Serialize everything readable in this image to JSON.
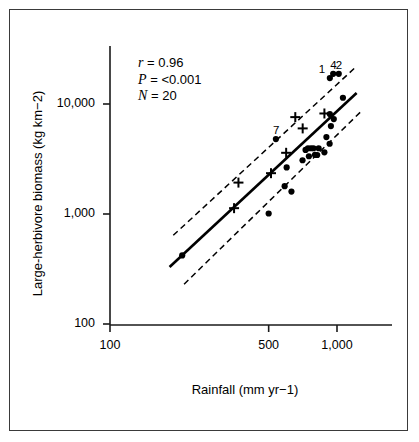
{
  "chart_data": {
    "type": "scatter",
    "title": "",
    "xlabel": "Rainfall (mm yr−1)",
    "ylabel": "Large-herbivore biomass (kg km−2)",
    "xscale": "log",
    "yscale": "log",
    "xlim": [
      100,
      1300
    ],
    "ylim": [
      100,
      30000
    ],
    "grid": false,
    "legend_position": "none",
    "xticks": [
      100,
      500,
      1000
    ],
    "xtick_labels": [
      "100",
      "500",
      "1,000"
    ],
    "yticks": [
      100,
      1000,
      10000
    ],
    "ytick_labels": [
      "100",
      "1,000",
      "10,000"
    ],
    "annotations": {
      "r_symbol": "r",
      "r_value": "= 0.96",
      "p_symbol": "P",
      "p_value": "= <0.001",
      "n_symbol": "N",
      "n_value": "= 20"
    },
    "series": [
      {
        "name": "study-sites",
        "marker": "filled-circle",
        "color": "#000000",
        "points": [
          {
            "x": 208,
            "y": 420,
            "label": ""
          },
          {
            "x": 500,
            "y": 1010,
            "label": ""
          },
          {
            "x": 588,
            "y": 1790,
            "label": ""
          },
          {
            "x": 630,
            "y": 1600,
            "label": ""
          },
          {
            "x": 600,
            "y": 2650,
            "label": ""
          },
          {
            "x": 538,
            "y": 4800,
            "label": "7"
          },
          {
            "x": 705,
            "y": 3080,
            "label": ""
          },
          {
            "x": 727,
            "y": 3820,
            "label": ""
          },
          {
            "x": 745,
            "y": 3960,
            "label": ""
          },
          {
            "x": 752,
            "y": 3350,
            "label": ""
          },
          {
            "x": 768,
            "y": 3960,
            "label": ""
          },
          {
            "x": 788,
            "y": 3960,
            "label": ""
          },
          {
            "x": 800,
            "y": 3450,
            "label": ""
          },
          {
            "x": 818,
            "y": 3440,
            "label": ""
          },
          {
            "x": 830,
            "y": 3960,
            "label": ""
          },
          {
            "x": 880,
            "y": 3640,
            "label": ""
          },
          {
            "x": 898,
            "y": 5000,
            "label": ""
          },
          {
            "x": 928,
            "y": 4350,
            "label": ""
          },
          {
            "x": 930,
            "y": 8100,
            "label": ""
          },
          {
            "x": 940,
            "y": 6300,
            "label": ""
          },
          {
            "x": 968,
            "y": 7300,
            "label": ""
          },
          {
            "x": 1062,
            "y": 11400,
            "label": ""
          },
          {
            "x": 930,
            "y": 17200,
            "label": "1"
          },
          {
            "x": 962,
            "y": 18800,
            "label": "4"
          },
          {
            "x": 1018,
            "y": 18800,
            "label": "2"
          }
        ]
      },
      {
        "name": "additional-sites",
        "marker": "plus",
        "color": "#000000",
        "points": [
          {
            "x": 352,
            "y": 1130,
            "label": ""
          },
          {
            "x": 368,
            "y": 1930,
            "label": ""
          },
          {
            "x": 512,
            "y": 2350,
            "label": ""
          },
          {
            "x": 597,
            "y": 3600,
            "label": ""
          },
          {
            "x": 655,
            "y": 7600,
            "label": ""
          },
          {
            "x": 706,
            "y": 6000,
            "label": ""
          },
          {
            "x": 880,
            "y": 8200,
            "label": ""
          }
        ]
      }
    ],
    "regression_line": {
      "name": "regression-line",
      "style": "solid",
      "color": "#000000",
      "x_start": 183,
      "y_start": 330,
      "x_end": 1220,
      "y_end": 12600
    },
    "confidence_bands": [
      {
        "name": "upper-confidence-band",
        "style": "dashed",
        "color": "#000000",
        "x_start": 190,
        "y_start": 640,
        "x_end": 1190,
        "y_end": 21000
      },
      {
        "name": "lower-confidence-band",
        "style": "dashed",
        "color": "#000000",
        "x_start": 212,
        "y_start": 230,
        "x_end": 1280,
        "y_end": 8600
      }
    ]
  },
  "figure": {
    "border_color": "#3a3a3a",
    "background": "#ffffff",
    "axis_color": "#1a1a1a"
  }
}
